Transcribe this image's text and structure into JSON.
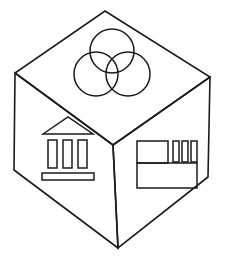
{
  "diagram": {
    "type": "line-drawing",
    "stroke_color": "#1b1b1b",
    "fill_color": "#ffffff",
    "stroke_width": 1.6,
    "canvas": {
      "width": 226,
      "height": 261
    },
    "geometry": {
      "vertices": {
        "top": [
          105,
          11
        ],
        "left": [
          15,
          73
        ],
        "right": [
          210,
          77
        ],
        "center": [
          113,
          145
        ],
        "bottom_left": [
          14,
          170
        ],
        "bottom_right": [
          208,
          177
        ],
        "bottom": [
          118,
          248
        ]
      },
      "faces": [
        {
          "name": "top-face",
          "label": "Top face",
          "polygon": "105,11 210,77 113,145 15,73"
        },
        {
          "name": "left-face",
          "label": "Left face",
          "polygon": "15,73 113,145 118,248 14,170"
        },
        {
          "name": "right-face",
          "label": "Right face",
          "polygon": "113,145 210,77 208,177 118,248"
        }
      ]
    },
    "icons": {
      "top": {
        "name": "venn-three-circles-icon",
        "label": "Three overlapping circles (Venn diagram)",
        "circle_count": 3,
        "radius": 22,
        "circles": [
          {
            "name": "venn-circle-top",
            "cx": 112,
            "cy": 51,
            "r": 22
          },
          {
            "name": "venn-circle-left",
            "cx": 96,
            "cy": 74,
            "r": 22
          },
          {
            "name": "venn-circle-right",
            "cx": 128,
            "cy": 74,
            "r": 22
          }
        ]
      },
      "left": {
        "name": "bank-building-icon",
        "label": "Classical bank building with pediment, three columns and base",
        "pediment": "43,134 68,117 93,134",
        "columns": [
          {
            "name": "bank-column-1",
            "x": 48,
            "y": 140,
            "w": 9,
            "h": 28
          },
          {
            "name": "bank-column-2",
            "x": 63,
            "y": 140,
            "w": 9,
            "h": 28
          },
          {
            "name": "bank-column-3",
            "x": 78,
            "y": 140,
            "w": 9,
            "h": 28
          }
        ],
        "base": {
          "name": "bank-base-bar",
          "x": 42,
          "y": 173,
          "w": 52,
          "h": 7
        }
      },
      "right": {
        "name": "layout-blocks-icon",
        "label": "Rectangular layout blocks: square, three bars, wide rectangle",
        "square": {
          "name": "layout-square-block",
          "x": 137,
          "y": 141,
          "w": 31,
          "h": 22
        },
        "bars": [
          {
            "name": "layout-bar-1",
            "x": 173,
            "y": 141,
            "w": 6,
            "h": 21
          },
          {
            "name": "layout-bar-2",
            "x": 182,
            "y": 141,
            "w": 6,
            "h": 21
          },
          {
            "name": "layout-bar-3",
            "x": 191,
            "y": 141,
            "w": 6,
            "h": 21
          }
        ],
        "wide_rectangle": {
          "name": "layout-wide-block",
          "x": 137,
          "y": 163,
          "w": 60,
          "h": 25
        }
      }
    }
  }
}
